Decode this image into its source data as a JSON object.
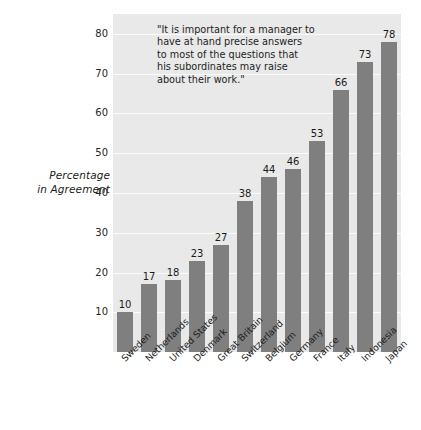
{
  "chart_data": {
    "type": "bar",
    "title": "",
    "subtitle": "",
    "annotation": "\"It is important for a manager to have at hand precise answers to most of the questions that his subordinates may raise about their work.\"",
    "annotation_lines": [
      "\"It is important for a manager to",
      "have at hand precise answers",
      "to most of the questions that",
      "his subordinates may raise",
      "about their work.\""
    ],
    "xlabel": "",
    "ylabel": "Percentage in Agreement",
    "ylabel_lines": [
      "Percentage",
      "in Agreement"
    ],
    "ylim": [
      0,
      85
    ],
    "yticks": [
      10,
      20,
      30,
      40,
      50,
      60,
      70,
      80
    ],
    "ytick_labels": [
      "10",
      "20",
      "30",
      "40",
      "50",
      "60",
      "70",
      "80"
    ],
    "grid": "horizontal",
    "legend": "none",
    "categories": [
      "Sweden",
      "Netherlands",
      "United States",
      "Denmark",
      "Great Britain",
      "Switzerland",
      "Belgium",
      "Germany",
      "France",
      "Italy",
      "Indonesia",
      "Japan"
    ],
    "values": [
      10,
      17,
      18,
      23,
      27,
      38,
      44,
      46,
      53,
      66,
      73,
      78
    ],
    "value_labels": [
      "10",
      "17",
      "18",
      "23",
      "27",
      "38",
      "44",
      "46",
      "53",
      "66",
      "73",
      "78"
    ],
    "colors": {
      "bar": "#7f7f80",
      "plot_background": "#e9e9e9",
      "gridline": "#fbfbfb",
      "text": "#1b1b1b",
      "page_background": "#ffffff"
    }
  }
}
